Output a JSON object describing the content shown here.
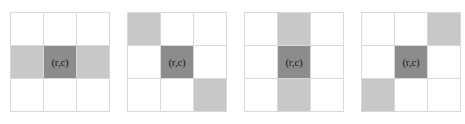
{
  "figure": {
    "center_label": "(r,c)",
    "colors": {
      "background": "#ffffff",
      "cell_empty": "#ffffff",
      "cell_neighbor_shaded": "#c8c8c8",
      "cell_center": "#8c8c8c",
      "grid_line": "#d9d9d9",
      "label_text": "#1a1a1a"
    },
    "grids": [
      {
        "name": "horizontal-neighbors",
        "rows": 3,
        "columns": 3,
        "cells": [
          [
            {
              "shade": "none",
              "label": ""
            },
            {
              "shade": "none",
              "label": ""
            },
            {
              "shade": "none",
              "label": ""
            }
          ],
          [
            {
              "shade": "light",
              "label": ""
            },
            {
              "shade": "dark",
              "label": "(r,c)"
            },
            {
              "shade": "light",
              "label": ""
            }
          ],
          [
            {
              "shade": "none",
              "label": ""
            },
            {
              "shade": "none",
              "label": ""
            },
            {
              "shade": "none",
              "label": ""
            }
          ]
        ]
      },
      {
        "name": "main-diagonal-neighbors",
        "rows": 3,
        "columns": 3,
        "cells": [
          [
            {
              "shade": "light",
              "label": ""
            },
            {
              "shade": "none",
              "label": ""
            },
            {
              "shade": "none",
              "label": ""
            }
          ],
          [
            {
              "shade": "none",
              "label": ""
            },
            {
              "shade": "dark",
              "label": "(r,c)"
            },
            {
              "shade": "none",
              "label": ""
            }
          ],
          [
            {
              "shade": "none",
              "label": ""
            },
            {
              "shade": "none",
              "label": ""
            },
            {
              "shade": "light",
              "label": ""
            }
          ]
        ]
      },
      {
        "name": "vertical-neighbors",
        "rows": 3,
        "columns": 3,
        "cells": [
          [
            {
              "shade": "none",
              "label": ""
            },
            {
              "shade": "light",
              "label": ""
            },
            {
              "shade": "none",
              "label": ""
            }
          ],
          [
            {
              "shade": "none",
              "label": ""
            },
            {
              "shade": "dark",
              "label": "(r,c)"
            },
            {
              "shade": "none",
              "label": ""
            }
          ],
          [
            {
              "shade": "none",
              "label": ""
            },
            {
              "shade": "light",
              "label": ""
            },
            {
              "shade": "none",
              "label": ""
            }
          ]
        ]
      },
      {
        "name": "anti-diagonal-neighbors",
        "rows": 3,
        "columns": 3,
        "cells": [
          [
            {
              "shade": "none",
              "label": ""
            },
            {
              "shade": "none",
              "label": ""
            },
            {
              "shade": "light",
              "label": ""
            }
          ],
          [
            {
              "shade": "none",
              "label": ""
            },
            {
              "shade": "dark",
              "label": "(r,c)"
            },
            {
              "shade": "none",
              "label": ""
            }
          ],
          [
            {
              "shade": "light",
              "label": ""
            },
            {
              "shade": "none",
              "label": ""
            },
            {
              "shade": "none",
              "label": ""
            }
          ]
        ]
      }
    ]
  }
}
